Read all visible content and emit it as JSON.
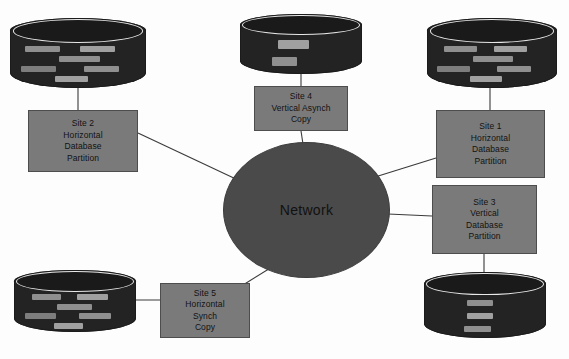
{
  "diagram": {
    "background_color": "#fdfdfd",
    "network": {
      "label": "Network",
      "color": "#4a4a4a"
    },
    "cylinder_color": "#232323",
    "record_color": "#8f8f8f",
    "box_color": "#7a7a7a",
    "edge_color": "#3a3a3a",
    "nodes": [
      {
        "id": "site2",
        "box_lines": [
          "Site 2",
          "Horizontal",
          "Database",
          "Partition"
        ],
        "db_pattern": "horizontal-partition",
        "db_records": 6
      },
      {
        "id": "site4",
        "box_lines": [
          "Site 4",
          "Vertical Asynch",
          "Copy"
        ],
        "db_pattern": "vertical-copy",
        "db_records": 2
      },
      {
        "id": "site1",
        "box_lines": [
          "Site 1",
          "Horizontal",
          "Database",
          "Partition"
        ],
        "db_pattern": "horizontal-partition",
        "db_records": 6
      },
      {
        "id": "site3",
        "box_lines": [
          "Site 3",
          "Vertical",
          "Database",
          "Partition"
        ],
        "db_pattern": "vertical-partition",
        "db_records": 3
      },
      {
        "id": "site5",
        "box_lines": [
          "Site 5",
          "Horizontal",
          "Synch",
          "Copy"
        ],
        "db_pattern": "horizontal-partition",
        "db_records": 6
      }
    ],
    "connections": [
      {
        "from": "db-site2",
        "to": "box-site2"
      },
      {
        "from": "box-site2",
        "to": "network"
      },
      {
        "from": "db-site4",
        "to": "box-site4"
      },
      {
        "from": "box-site4",
        "to": "network"
      },
      {
        "from": "db-site1",
        "to": "box-site1"
      },
      {
        "from": "box-site1",
        "to": "network"
      },
      {
        "from": "box-site3",
        "to": "network"
      },
      {
        "from": "box-site3",
        "to": "db-site3"
      },
      {
        "from": "db-site5",
        "to": "box-site5"
      },
      {
        "from": "box-site5",
        "to": "network"
      }
    ]
  }
}
